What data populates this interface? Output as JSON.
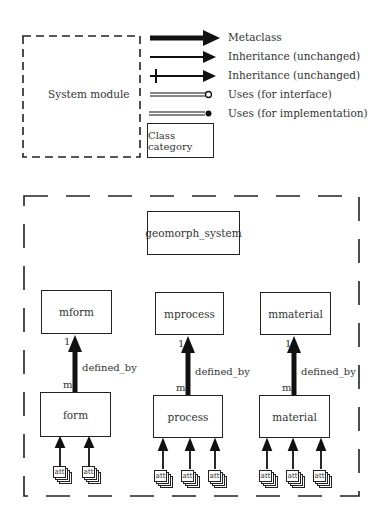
{
  "legend": {
    "system_module_label": "System module",
    "class_category_label": "Class category",
    "items": [
      {
        "label": "Metaclass",
        "line": "thick-arrow"
      },
      {
        "label": "Inheritance (unchanged)",
        "line": "arrow"
      },
      {
        "label": "Inheritance (unchanged)",
        "line": "crossed-arrow"
      },
      {
        "label": "Uses (for interface)",
        "line": "double-line-open-circle"
      },
      {
        "label": "Uses (for implementation)",
        "line": "double-line-filled-circle"
      }
    ]
  },
  "diagram": {
    "system": "geomorph_system",
    "columns": [
      {
        "metaclass": "mform",
        "class": "form",
        "relation": "defined_by",
        "upper_multiplicity": "1",
        "lower_multiplicity": "m",
        "attribute_count": 2,
        "attribute_label": "att"
      },
      {
        "metaclass": "mprocess",
        "class": "process",
        "relation": "defined_by",
        "upper_multiplicity": "1",
        "lower_multiplicity": "m",
        "attribute_count": 3,
        "attribute_label": "att"
      },
      {
        "metaclass": "mmaterial",
        "class": "material",
        "relation": "defined_by",
        "upper_multiplicity": "1",
        "lower_multiplicity": "m",
        "attribute_count": 3,
        "attribute_label": "att"
      }
    ]
  },
  "colors": {
    "ink": "#222222",
    "text": "#333333",
    "background": "#ffffff"
  }
}
